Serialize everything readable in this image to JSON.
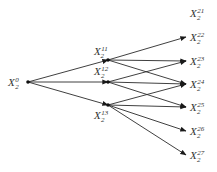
{
  "diagram": {
    "type": "tree-graph",
    "nodes": [
      {
        "id": "X0",
        "base": "X",
        "sub": "2",
        "sup": "0",
        "x": 28,
        "y": 82,
        "lx": 8,
        "ly": 86
      },
      {
        "id": "X11",
        "base": "X",
        "sub": "2",
        "sup": "11",
        "x": 108,
        "y": 60,
        "lx": 94,
        "ly": 55
      },
      {
        "id": "X12",
        "base": "X",
        "sub": "2",
        "sup": "12",
        "x": 108,
        "y": 82,
        "lx": 94,
        "ly": 75
      },
      {
        "id": "X13",
        "base": "X",
        "sub": "2",
        "sup": "13",
        "x": 108,
        "y": 105,
        "lx": 94,
        "ly": 119
      },
      {
        "id": "X21",
        "base": "X",
        "sub": "2",
        "sup": "21",
        "x": 188,
        "y": 13,
        "lx": 190,
        "ly": 17
      },
      {
        "id": "X22",
        "base": "X",
        "sub": "2",
        "sup": "22",
        "x": 186,
        "y": 37,
        "lx": 190,
        "ly": 41
      },
      {
        "id": "X23",
        "base": "X",
        "sub": "2",
        "sup": "23",
        "x": 186,
        "y": 61,
        "lx": 190,
        "ly": 65
      },
      {
        "id": "X24",
        "base": "X",
        "sub": "2",
        "sup": "24",
        "x": 186,
        "y": 84,
        "lx": 190,
        "ly": 88
      },
      {
        "id": "X25",
        "base": "X",
        "sub": "2",
        "sup": "25",
        "x": 186,
        "y": 107,
        "lx": 190,
        "ly": 111
      },
      {
        "id": "X26",
        "base": "X",
        "sub": "2",
        "sup": "26",
        "x": 186,
        "y": 131,
        "lx": 190,
        "ly": 135
      },
      {
        "id": "X27",
        "base": "X",
        "sub": "2",
        "sup": "27",
        "x": 186,
        "y": 155,
        "lx": 190,
        "ly": 159
      }
    ],
    "edges": [
      [
        "X0",
        "X11"
      ],
      [
        "X0",
        "X12"
      ],
      [
        "X0",
        "X13"
      ],
      [
        "X11",
        "X22"
      ],
      [
        "X11",
        "X23"
      ],
      [
        "X11",
        "X24"
      ],
      [
        "X12",
        "X23"
      ],
      [
        "X12",
        "X24"
      ],
      [
        "X12",
        "X25"
      ],
      [
        "X13",
        "X24"
      ],
      [
        "X13",
        "X25"
      ],
      [
        "X13",
        "X26"
      ],
      [
        "X13",
        "X27"
      ]
    ]
  }
}
